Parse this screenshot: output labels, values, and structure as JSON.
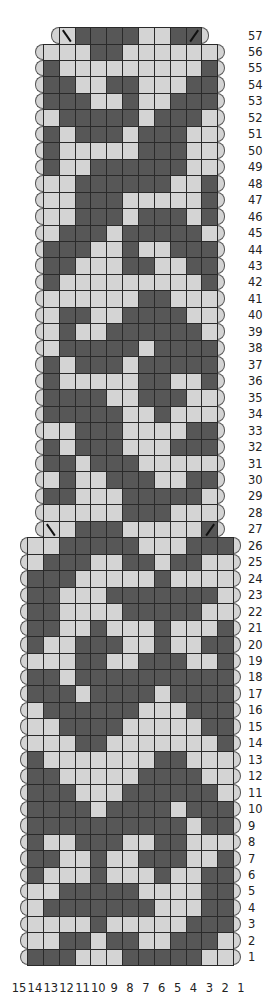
{
  "chart_data": {
    "type": "table",
    "title": "",
    "colors": {
      "dark": "#575757",
      "light": "#d4d4d4",
      "grid": "#2a2a2a"
    },
    "column_labels": [
      "15",
      "14",
      "13",
      "12",
      "11",
      "10",
      "9",
      "8",
      "7",
      "6",
      "5",
      "4",
      "3",
      "2",
      "1"
    ],
    "row_labels_side": "right",
    "decreases": [
      {
        "row": 57,
        "col": 12,
        "symbol": "\\",
        "meaning": "left-leaning decrease"
      },
      {
        "row": 57,
        "col": 4,
        "symbol": "/",
        "meaning": "right-leaning decrease"
      },
      {
        "row": 27,
        "col": 13,
        "symbol": "\\",
        "meaning": "left-leaning decrease"
      },
      {
        "row": 27,
        "col": 3,
        "symbol": "/",
        "meaning": "right-leaning decrease"
      }
    ],
    "rows": [
      {
        "row": 57,
        "first_col": 12,
        "cells": "LDDDDLLDD"
      },
      {
        "row": 56,
        "first_col": 13,
        "cells": "LLLDDLLLLLL"
      },
      {
        "row": 55,
        "first_col": 13,
        "cells": "DLLLLLLLLLD"
      },
      {
        "row": 54,
        "first_col": 13,
        "cells": "DDLLDDLLLDD"
      },
      {
        "row": 53,
        "first_col": 13,
        "cells": "DDDLLDLLDDD"
      },
      {
        "row": 52,
        "first_col": 13,
        "cells": "LDDDDDLDDDL"
      },
      {
        "row": 51,
        "first_col": 13,
        "cells": "DLDDDLDDDLL"
      },
      {
        "row": 50,
        "first_col": 13,
        "cells": "DLLLLLDDDLL"
      },
      {
        "row": 49,
        "first_col": 13,
        "cells": "DLLDDDDDDLL"
      },
      {
        "row": 48,
        "first_col": 13,
        "cells": "LLDDDDDDLLD"
      },
      {
        "row": 47,
        "first_col": 13,
        "cells": "LLDDDLLLLLD"
      },
      {
        "row": 46,
        "first_col": 13,
        "cells": "LLDDDLDDDLD"
      },
      {
        "row": 45,
        "first_col": 13,
        "cells": "LDDDLDDDDDL"
      },
      {
        "row": 44,
        "first_col": 13,
        "cells": "DDDLLDLLDDD"
      },
      {
        "row": 43,
        "first_col": 13,
        "cells": "DDLLLDDLLDD"
      },
      {
        "row": 42,
        "first_col": 13,
        "cells": "DLLLLLLLLLD"
      },
      {
        "row": 41,
        "first_col": 13,
        "cells": "LLLLLLDDLLL"
      },
      {
        "row": 40,
        "first_col": 13,
        "cells": "LDDLLDDDDLL"
      },
      {
        "row": 39,
        "first_col": 13,
        "cells": "LDLLDDDDDDL"
      },
      {
        "row": 38,
        "first_col": 13,
        "cells": "LDDDDDLDDDD"
      },
      {
        "row": 37,
        "first_col": 13,
        "cells": "DLDDDLDDDDD"
      },
      {
        "row": 36,
        "first_col": 13,
        "cells": "DLLLLLDDLLD"
      },
      {
        "row": 35,
        "first_col": 13,
        "cells": "DDDDLLDDDLL"
      },
      {
        "row": 34,
        "first_col": 13,
        "cells": "DDDDDLLDLLL"
      },
      {
        "row": 33,
        "first_col": 13,
        "cells": "LLDDDLLLLDD"
      },
      {
        "row": 32,
        "first_col": 13,
        "cells": "DLDDDLLLDDD"
      },
      {
        "row": 31,
        "first_col": 13,
        "cells": "DDLDDDLLLLL"
      },
      {
        "row": 30,
        "first_col": 13,
        "cells": "LDLLDDDLLDD"
      },
      {
        "row": 29,
        "first_col": 13,
        "cells": "DDLLLDDDDDL"
      },
      {
        "row": 28,
        "first_col": 13,
        "cells": "LLLLLDDDLLL"
      },
      {
        "row": 27,
        "first_col": 13,
        "cells": "LLDDDLLLLLD"
      },
      {
        "row": 26,
        "first_col": 14,
        "cells": "LLDDDDDLLLDDD"
      },
      {
        "row": 25,
        "first_col": 14,
        "cells": "LDDDLLDDLDDLL"
      },
      {
        "row": 24,
        "first_col": 14,
        "cells": "DDDLLLLLDLLLL"
      },
      {
        "row": 23,
        "first_col": 14,
        "cells": "DDLLLDDDDDDDL"
      },
      {
        "row": 22,
        "first_col": 14,
        "cells": "DDLLLLDDDDDLL"
      },
      {
        "row": 21,
        "first_col": 14,
        "cells": "DDLLDLLLDLLLD"
      },
      {
        "row": 20,
        "first_col": 14,
        "cells": "DLLDDDLLDLLDD"
      },
      {
        "row": 19,
        "first_col": 14,
        "cells": "LLLDDLLDDDLLD"
      },
      {
        "row": 18,
        "first_col": 14,
        "cells": "DDLDDDDDDDDDD"
      },
      {
        "row": 17,
        "first_col": 14,
        "cells": "DDDLDDDDLDDDD"
      },
      {
        "row": 16,
        "first_col": 14,
        "cells": "LDDDDDDLLLDDD"
      },
      {
        "row": 15,
        "first_col": 14,
        "cells": "LLDDDDLLLLLDD"
      },
      {
        "row": 14,
        "first_col": 14,
        "cells": "LLLDDLLLLLLLD"
      },
      {
        "row": 13,
        "first_col": 14,
        "cells": "DLLLLLLLDDLLL"
      },
      {
        "row": 12,
        "first_col": 14,
        "cells": "DDLLLLLDDDDLL"
      },
      {
        "row": 11,
        "first_col": 14,
        "cells": "DDDLLLDDDDDDL"
      },
      {
        "row": 10,
        "first_col": 14,
        "cells": "DDDDLDDDDLDDD"
      },
      {
        "row": 9,
        "first_col": 14,
        "cells": "DDDDDDDDDDLDD"
      },
      {
        "row": 8,
        "first_col": 14,
        "cells": "DLLDDDLLDDLLL"
      },
      {
        "row": 7,
        "first_col": 14,
        "cells": "DDLLDLLDDDLLD"
      },
      {
        "row": 6,
        "first_col": 14,
        "cells": "DLLLDLLLDLLDD"
      },
      {
        "row": 5,
        "first_col": 14,
        "cells": "LLDDDDDLLLLDD"
      },
      {
        "row": 4,
        "first_col": 14,
        "cells": "LDDDDDDDLLLDD"
      },
      {
        "row": 3,
        "first_col": 14,
        "cells": "LLLLDLLLLLDDD"
      },
      {
        "row": 2,
        "first_col": 14,
        "cells": "LLDDLDDLLDDDL"
      },
      {
        "row": 1,
        "first_col": 14,
        "cells": "DDDLLLDDDDDLL"
      }
    ]
  }
}
